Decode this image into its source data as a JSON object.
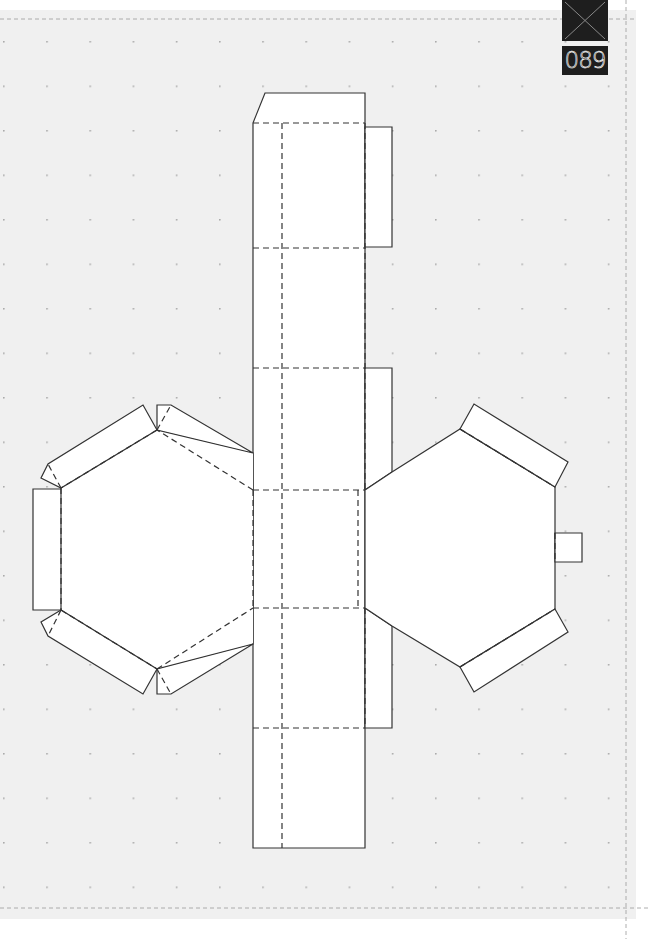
{
  "page": {
    "number": "089",
    "background": "#f0f0f0",
    "paper": "#ffffff",
    "line_color": "#333333",
    "guide_color": "#9a9a9a"
  },
  "badge": {
    "icon": "x-mark-icon",
    "label": "089"
  },
  "template": {
    "type": "papercraft-net",
    "description": "Hexagonal prism die-cut template",
    "parts": [
      "center-strip",
      "left-hexagon",
      "right-hexagon",
      "glue-tabs"
    ]
  }
}
